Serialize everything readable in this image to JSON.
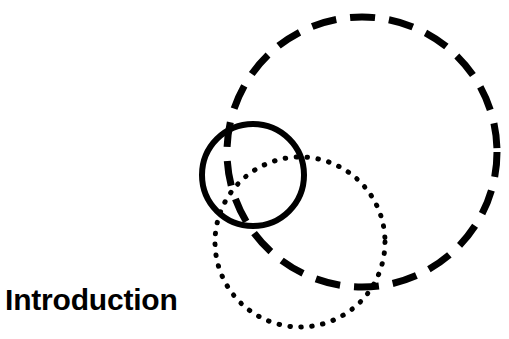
{
  "slide": {
    "background_color": "#ffffff",
    "heading": "Introduction",
    "heading_color": "#000000"
  },
  "diagram": {
    "name": "three-overlapping-circles-venn",
    "stroke_color": "#000000",
    "fill": "none",
    "circles": [
      {
        "id": "solid-circle",
        "label": "solid-circle",
        "style": "solid",
        "cx": 253,
        "cy": 175,
        "r": 51,
        "stroke_width": 6,
        "dash_pattern": "none"
      },
      {
        "id": "dashed-circle",
        "label": "dashed-circle",
        "style": "dashed",
        "cx": 362,
        "cy": 152,
        "r": 135,
        "stroke_width": 7,
        "dash_pattern": "25 14"
      },
      {
        "id": "dotted-circle",
        "label": "dotted-circle",
        "style": "dotted",
        "cx": 300,
        "cy": 242,
        "r": 85,
        "stroke_width": 5,
        "dash_pattern": "0.5 10.5"
      }
    ]
  }
}
